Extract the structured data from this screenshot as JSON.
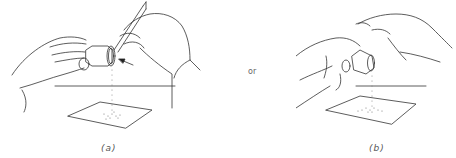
{
  "figure": {
    "panels": [
      {
        "id": "a",
        "label": "(a)",
        "description": "Left hand holds a tilted vial while right hand taps it with a pencil; arrow points to the tap location; powder falls onto a sheet of paper"
      },
      {
        "id": "b",
        "label": "(b)",
        "description": "Left hand holds a tilted vial while right hand's finger taps it; powder falls onto a sheet of paper"
      }
    ],
    "connector": "or"
  }
}
